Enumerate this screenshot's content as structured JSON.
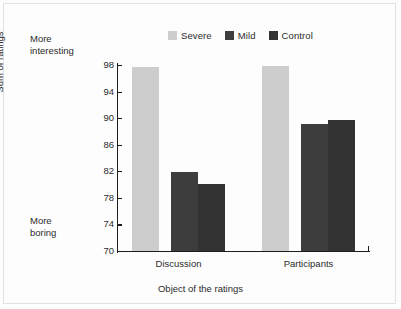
{
  "annotations": {
    "top_left": "More\ninteresting",
    "bottom_left": "More\nboring"
  },
  "chart_data": {
    "type": "bar",
    "title": "",
    "xlabel": "Object of the ratings",
    "ylabel": "Sum of ratings",
    "categories": [
      "Discussion",
      "Participants"
    ],
    "series": [
      {
        "name": "Severe",
        "color": "#cdcdcd",
        "values": [
          97.7,
          97.8
        ]
      },
      {
        "name": "Mild",
        "color": "#3d3d3d",
        "values": [
          81.9,
          89.1
        ]
      },
      {
        "name": "Control",
        "color": "#333333",
        "values": [
          80.1,
          89.7
        ]
      }
    ],
    "ylim": [
      70,
      98
    ],
    "yticks": [
      70,
      74,
      78,
      82,
      86,
      90,
      94,
      98
    ],
    "grid": false,
    "legend_position": "top-center"
  },
  "legend": {
    "entries": [
      {
        "label": "Severe",
        "color": "#cdcdcd"
      },
      {
        "label": "Mild",
        "color": "#3d3d3d"
      },
      {
        "label": "Control",
        "color": "#333333"
      }
    ]
  }
}
